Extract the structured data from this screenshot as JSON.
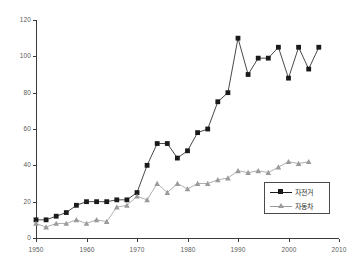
{
  "chart_data": {
    "type": "line",
    "title": "",
    "subtitle": "",
    "xlabel": "",
    "ylabel": "",
    "xlim": [
      1950,
      2010
    ],
    "ylim": [
      0,
      120
    ],
    "grid": false,
    "legend_position": "lower-right",
    "y_ticks": [
      0,
      20,
      40,
      60,
      80,
      100,
      120
    ],
    "x_ticks": [
      1950,
      1960,
      1970,
      1980,
      1990,
      2000,
      2010
    ],
    "y_tick_labels": [
      "0",
      "20",
      "40",
      "60",
      "80",
      "100",
      "120"
    ],
    "x_tick_labels": [
      "1950",
      "1960",
      "1970",
      "1980",
      "1990",
      "2000",
      "2010"
    ],
    "series": [
      {
        "name": "자전거",
        "color": "#1a1a1a",
        "marker": "square",
        "x": [
          1950,
          1952,
          1954,
          1956,
          1958,
          1960,
          1962,
          1964,
          1966,
          1968,
          1970,
          1972,
          1974,
          1976,
          1978,
          1980,
          1982,
          1984,
          1986,
          1988,
          1990,
          1992,
          1994,
          1996,
          1998,
          2000,
          2002,
          2004,
          2006
        ],
        "values": [
          10,
          10,
          12,
          14,
          18,
          20,
          20,
          20,
          21,
          21,
          25,
          40,
          52,
          52,
          44,
          48,
          58,
          60,
          75,
          80,
          110,
          90,
          99,
          99,
          105,
          88,
          105,
          93,
          105
        ]
      },
      {
        "name": "자동차",
        "color": "#9a9a9a",
        "marker": "triangle",
        "x": [
          1950,
          1952,
          1954,
          1956,
          1958,
          1960,
          1962,
          1964,
          1966,
          1968,
          1970,
          1972,
          1974,
          1976,
          1978,
          1980,
          1982,
          1984,
          1986,
          1988,
          1990,
          1992,
          1994,
          1996,
          1998,
          2000,
          2002,
          2004
        ],
        "values": [
          8,
          6,
          8,
          8,
          10,
          8,
          10,
          9,
          17,
          18,
          23,
          21,
          30,
          25,
          30,
          27,
          30,
          30,
          32,
          33,
          37,
          36,
          37,
          36,
          39,
          42,
          41,
          42
        ]
      }
    ],
    "legend_entries": [
      {
        "label": "자전거",
        "marker": "square",
        "color": "#1a1a1a"
      },
      {
        "label": "자동차",
        "marker": "triangle",
        "color": "#9a9a9a"
      }
    ]
  }
}
